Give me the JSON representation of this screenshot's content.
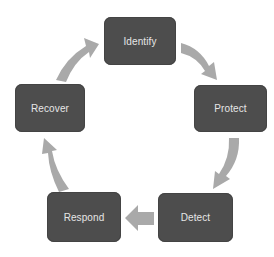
{
  "diagram": {
    "type": "cycle",
    "colors": {
      "node_fill": "#4d4d4d",
      "node_text": "#e6e6e6",
      "arrow_fill": "#a9a9a9",
      "background": "#ffffff"
    },
    "nodes": [
      {
        "id": "identify",
        "label": "Identify"
      },
      {
        "id": "protect",
        "label": "Protect"
      },
      {
        "id": "detect",
        "label": "Detect"
      },
      {
        "id": "respond",
        "label": "Respond"
      },
      {
        "id": "recover",
        "label": "Recover"
      }
    ],
    "edges": [
      {
        "from": "Identify",
        "to": "Protect"
      },
      {
        "from": "Protect",
        "to": "Detect"
      },
      {
        "from": "Detect",
        "to": "Respond"
      },
      {
        "from": "Respond",
        "to": "Recover"
      },
      {
        "from": "Recover",
        "to": "Identify"
      }
    ]
  }
}
